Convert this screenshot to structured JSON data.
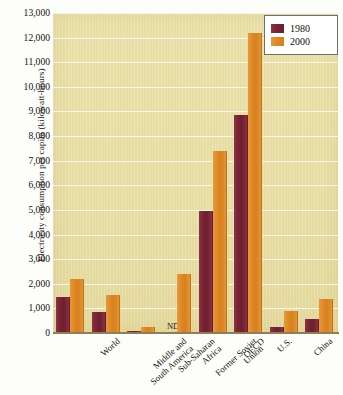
{
  "chart_data": {
    "type": "bar",
    "title": "",
    "xlabel": "",
    "ylabel": "Electricity consumption per capita (kilowatt-hours)",
    "ylim": [
      0,
      13000
    ],
    "ytick_labels": [
      "13,000",
      "12,000",
      "11,000",
      "10,000",
      "9,000",
      "8,000",
      "7,000",
      "6,000",
      "5,000",
      "4,000",
      "3,000",
      "2,000",
      "1,000",
      "0"
    ],
    "ytick_values": [
      13000,
      12000,
      11000,
      10000,
      9000,
      8000,
      7000,
      6000,
      5000,
      4000,
      3000,
      2000,
      1000,
      0
    ],
    "grid": true,
    "legend_position": "top-right",
    "categories": [
      "World",
      "Middle and\nSouth America",
      "Sub-Saharan\nAfrica",
      "Former Soviet\nUnion",
      "OECD",
      "U.S.",
      "China",
      "Arab States"
    ],
    "series": [
      {
        "name": "1980",
        "color": "#7b2436",
        "values": [
          1450,
          850,
          100,
          null,
          4950,
          8850,
          250,
          550
        ],
        "missing_label": "ND"
      },
      {
        "name": "2000",
        "color": "#e08a26",
        "values": [
          2200,
          1550,
          230,
          2400,
          7400,
          12200,
          900,
          1400
        ]
      }
    ]
  },
  "legend": {
    "entries": [
      {
        "label": "1980",
        "color": "#7b2436"
      },
      {
        "label": "2000",
        "color": "#e08a26"
      }
    ]
  },
  "annotations": {
    "nd": "ND"
  },
  "colors": {
    "plot_background": "#e7dda2",
    "series_1980": "#7b2436",
    "series_2000": "#e08a26",
    "gridline": "#ffffff",
    "axis": "#8a7f55"
  }
}
